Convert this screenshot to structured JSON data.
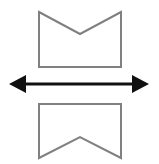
{
  "figure": {
    "title": "Shape transformation: notched-top pentagon to ribbon banner",
    "canvas": {
      "width": 159,
      "height": 164,
      "background_color": "#ffffff"
    },
    "palette": {
      "outline_color": "#808080",
      "arrow_color": "#111111",
      "fill_color": "none"
    },
    "shapes": {
      "top": {
        "name": "notched-top-pentagon",
        "label": "Top shape",
        "stroke_color": "#808080",
        "stroke_width": 2,
        "fill": "none",
        "points": "39,12 80,34 121,12 121,67 39,67",
        "vertices": [
          {
            "name": "top-left",
            "x": 39,
            "y": 12
          },
          {
            "name": "top-notch-vertex",
            "x": 80,
            "y": 34
          },
          {
            "name": "top-right",
            "x": 121,
            "y": 12
          },
          {
            "name": "bottom-right",
            "x": 121,
            "y": 67
          },
          {
            "name": "bottom-left",
            "x": 39,
            "y": 67
          }
        ]
      },
      "bottom": {
        "name": "ribbon-banner",
        "label": "Bottom shape",
        "stroke_color": "#808080",
        "stroke_width": 2,
        "fill": "none",
        "points": "39,104 121,104 121,158 80,137 39,158",
        "vertices": [
          {
            "name": "top-left",
            "x": 39,
            "y": 104
          },
          {
            "name": "top-right",
            "x": 121,
            "y": 104
          },
          {
            "name": "bottom-right",
            "x": 121,
            "y": 158
          },
          {
            "name": "bottom-notch-apex",
            "x": 80,
            "y": 137
          },
          {
            "name": "bottom-left",
            "x": 39,
            "y": 158
          }
        ]
      }
    },
    "arrow": {
      "name": "double-headed-horizontal-arrow",
      "label": "Double-headed arrow",
      "color": "#111111",
      "orientation": "horizontal",
      "double_headed": true,
      "shaft": {
        "x1": 22,
        "y1": 84,
        "x2": 136,
        "y2": 84,
        "width": 3
      },
      "left_head": {
        "points": "9,84 26,75 26,93",
        "tip_x": 9,
        "tip_y": 84
      },
      "right_head": {
        "points": "149,84 132,75 132,93",
        "tip_x": 149,
        "tip_y": 84
      }
    }
  }
}
